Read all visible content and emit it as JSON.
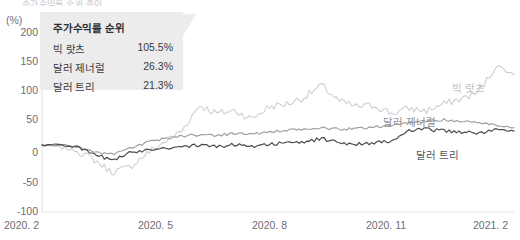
{
  "crop_title": "주가수익률 순위 추이",
  "axis": {
    "unit_label": "(%)",
    "y_ticks": [
      "200",
      "150",
      "100",
      "50",
      "0",
      "-50",
      "-100"
    ],
    "x_ticks": [
      "2020. 2",
      "2020. 5",
      "2020. 8",
      "2020. 11",
      "2021. 2"
    ]
  },
  "callout": {
    "title": "주가수익률 순위",
    "rows": [
      {
        "name": "빅 랏츠",
        "value": "105.5%"
      },
      {
        "name": "달러 제너럴",
        "value": "26.3%"
      },
      {
        "name": "달러 트리",
        "value": "21.3%"
      }
    ]
  },
  "series_labels": {
    "big_lots": "빅 랏츠",
    "dollar_general": "달러 제너럴",
    "dollar_tree": "달러 트리"
  },
  "colors": {
    "big_lots": "#cfcfd3",
    "dollar_general": "#9a9a9f",
    "dollar_tree": "#4b4b50",
    "axis": "#d6d6d9",
    "text": "#6d6d72",
    "callout_bg": "#ececed"
  },
  "chart_data": {
    "type": "line",
    "title": "주가수익률 순위 추이",
    "xlabel": "",
    "ylabel": "(%)",
    "ylim": [
      -100,
      200
    ],
    "ytick_values": [
      200,
      150,
      100,
      50,
      0,
      -50,
      -100
    ],
    "xtick_labels": [
      "2020. 2",
      "2020. 5",
      "2020. 8",
      "2020. 11",
      "2021. 2"
    ],
    "grid": false,
    "legend": "callout box, upper-left",
    "x": [
      "2020-02",
      "2020-02-15",
      "2020-03-01",
      "2020-03-10",
      "2020-03-18",
      "2020-03-23",
      "2020-04-01",
      "2020-04-15",
      "2020-05-01",
      "2020-05-15",
      "2020-06-01",
      "2020-06-15",
      "2020-07-01",
      "2020-07-15",
      "2020-08-01",
      "2020-08-15",
      "2020-09-01",
      "2020-09-15",
      "2020-10-01",
      "2020-10-15",
      "2020-11-01",
      "2020-11-15",
      "2020-12-01",
      "2020-12-15",
      "2021-01-01",
      "2021-01-15",
      "2021-02-01",
      "2021-02-15"
    ],
    "series": [
      {
        "name": "빅 랏츠",
        "final_value": 105.5,
        "color": "#cfcfd3",
        "values": [
          0,
          -3,
          -8,
          -22,
          -40,
          -33,
          -12,
          5,
          22,
          60,
          48,
          52,
          40,
          58,
          62,
          72,
          90,
          66,
          58,
          60,
          48,
          55,
          52,
          62,
          70,
          80,
          120,
          105.5
        ]
      },
      {
        "name": "달러 제너럴",
        "final_value": 26.3,
        "color": "#9a9a9f",
        "values": [
          0,
          2,
          -2,
          -10,
          -14,
          -5,
          4,
          10,
          14,
          16,
          15,
          18,
          17,
          20,
          22,
          24,
          26,
          24,
          25,
          28,
          30,
          34,
          36,
          38,
          36,
          34,
          30,
          26.3
        ]
      },
      {
        "name": "달러 트리",
        "final_value": 21.3,
        "color": "#4b4b50",
        "values": [
          0,
          1,
          -3,
          -14,
          -22,
          -12,
          -6,
          -4,
          -2,
          0,
          -2,
          1,
          -1,
          2,
          3,
          5,
          10,
          4,
          2,
          4,
          6,
          22,
          24,
          22,
          20,
          18,
          24,
          21.3
        ]
      }
    ]
  }
}
